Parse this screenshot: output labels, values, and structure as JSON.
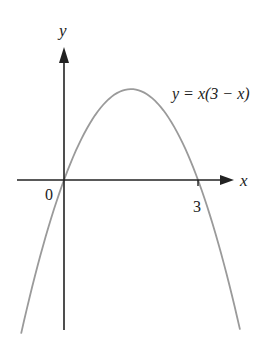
{
  "chart_data": {
    "type": "line",
    "title": "",
    "equation_label": "y = x(3 − x)",
    "xlabel": "x",
    "ylabel": "y",
    "x_tick_labels": [
      "0",
      "3"
    ],
    "x_ticks": [
      0,
      3
    ],
    "xlim": [
      -1.05,
      3.95
    ],
    "ylim": [
      -3.8,
      3.25
    ],
    "grid": false,
    "legend": null,
    "series": [
      {
        "name": "y = x(3 − x)",
        "x": [
          -0.96,
          -0.5,
          0,
          0.5,
          1,
          1.5,
          2,
          2.5,
          3,
          3.5,
          3.94
        ],
        "y": [
          -3.8,
          -1.75,
          0,
          1.25,
          2,
          2.25,
          2,
          1.25,
          0,
          -1.75,
          -3.7
        ]
      }
    ],
    "annotations": [
      {
        "text": "y = x(3 − x)",
        "position": "upper right of curve vertex"
      }
    ],
    "colors": {
      "axes": "#222222",
      "curve": "#9a9a9a",
      "background": "#ffffff"
    }
  },
  "labels": {
    "y_axis": "y",
    "x_axis": "x",
    "origin": "0",
    "x_intercept": "3",
    "equation": "y = x(3 − x)"
  }
}
